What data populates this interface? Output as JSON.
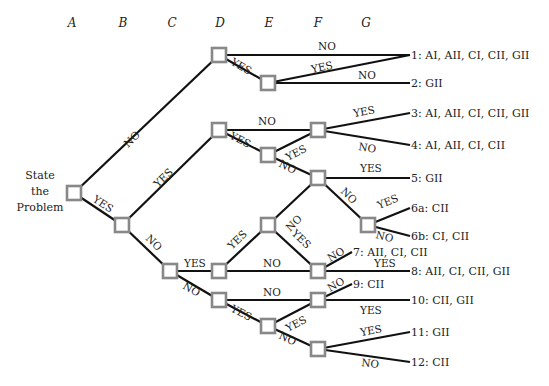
{
  "columns": [
    "A",
    "B",
    "C",
    "D",
    "E",
    "F",
    "G"
  ],
  "root_label": [
    "State",
    "the",
    "Problem"
  ],
  "branch_labels": {
    "yes": "YES",
    "no": "NO"
  },
  "outcomes": [
    {
      "id": "1",
      "text": "1: AI, AII, CI, CII, GII"
    },
    {
      "id": "2",
      "text": "2: GII"
    },
    {
      "id": "3",
      "text": "3: AI, AII, CI, CII, GII"
    },
    {
      "id": "4",
      "text": "4: AI, AII, CI, CII"
    },
    {
      "id": "5",
      "text": "5: GII"
    },
    {
      "id": "6a",
      "text": "6a: CII"
    },
    {
      "id": "6b",
      "text": "6b: CI, CII"
    },
    {
      "id": "7",
      "text": "7: AII, CI, CII"
    },
    {
      "id": "8",
      "text": "8: AII, CI, CII, GII"
    },
    {
      "id": "9",
      "text": "9: CII"
    },
    {
      "id": "10",
      "text": "10: CII, GII"
    },
    {
      "id": "11",
      "text": "11: GII"
    },
    {
      "id": "12",
      "text": "12: CII"
    }
  ],
  "colors": {
    "edge": "#111111",
    "node_border": "#888888",
    "text": "#222222"
  }
}
